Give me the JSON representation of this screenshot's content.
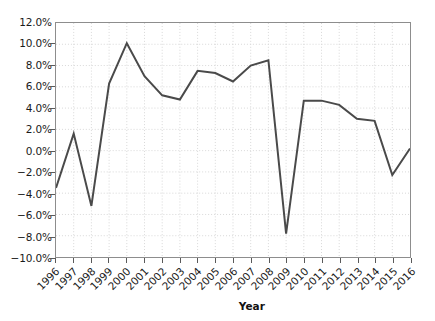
{
  "chart_data": {
    "type": "line",
    "title": "",
    "xlabel": "Year",
    "ylabel": "",
    "grid": true,
    "legend": "none",
    "xlim": [
      1996,
      2016
    ],
    "ylim": [
      -10.0,
      12.0
    ],
    "ytick_labels": [
      "12.0%",
      "10.0%",
      "8.0%",
      "6.0%",
      "4.0%",
      "2.0%",
      "0.0%",
      "−2.0%",
      "−4.0%",
      "−6.0%",
      "−8.0%",
      "−10.0%"
    ],
    "ytick_values": [
      12.0,
      10.0,
      8.0,
      6.0,
      4.0,
      2.0,
      0.0,
      -2.0,
      -4.0,
      -6.0,
      -8.0,
      -10.0
    ],
    "categories": [
      "1996",
      "1997",
      "1998",
      "1999",
      "2000",
      "2001",
      "2002",
      "2003",
      "2004",
      "2005",
      "2006",
      "2007",
      "2008",
      "2009",
      "2010",
      "2011",
      "2012",
      "2013",
      "2014",
      "2015",
      "2016"
    ],
    "values": [
      -3.5,
      1.6,
      -5.2,
      6.3,
      10.1,
      7.0,
      5.2,
      4.8,
      7.5,
      7.3,
      6.5,
      8.0,
      8.5,
      -7.8,
      4.7,
      4.7,
      4.3,
      3.0,
      2.8,
      -2.3,
      0.2
    ],
    "unit": "%",
    "series_color": "#4a4a4a",
    "series_width_px": 2,
    "grid_color": "#d8d8d8",
    "axis_color": "#8d8d8d",
    "background": "#ffffff"
  }
}
